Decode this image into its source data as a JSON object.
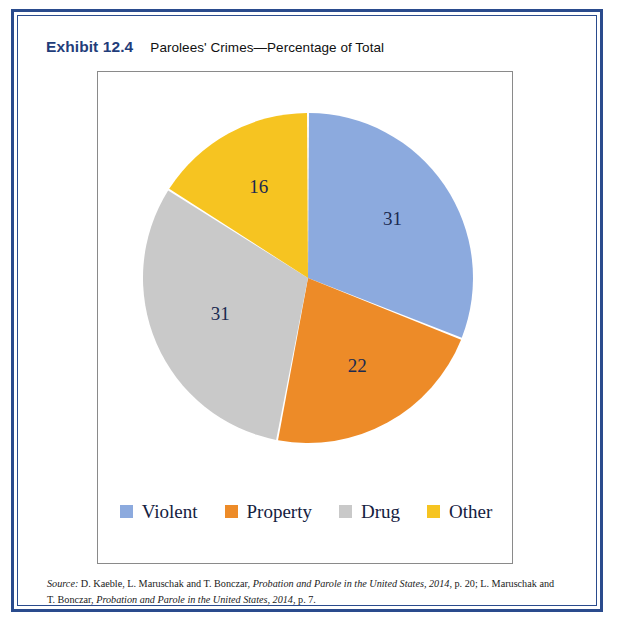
{
  "frame": {
    "border_color": "#2a4b8d"
  },
  "header": {
    "exhibit_label": "Exhibit 12.4",
    "title": "Parolees' Crimes—Percentage of Total"
  },
  "chart_data": {
    "type": "pie",
    "title": "Parolees' Crimes—Percentage of Total",
    "categories": [
      "Violent",
      "Property",
      "Drug",
      "Other"
    ],
    "values": [
      31,
      22,
      31,
      16
    ],
    "value_suffix": "",
    "colors": [
      "#8caade",
      "#ed8b28",
      "#c9c9c9",
      "#f6c421"
    ],
    "legend_position": "bottom",
    "start_angle_deg": 0,
    "direction": "clockwise",
    "slice_gap": true,
    "data_labels": [
      "31",
      "22",
      "31",
      "16"
    ],
    "label_color": "#1b2a50",
    "xlabel": "",
    "ylabel": ""
  },
  "legend": {
    "items": [
      {
        "label": "Violent",
        "color": "#8caade"
      },
      {
        "label": "Property",
        "color": "#ed8b28"
      },
      {
        "label": "Drug",
        "color": "#c9c9c9"
      },
      {
        "label": "Other",
        "color": "#f6c421"
      }
    ]
  },
  "source": {
    "line1_prefix": "Source:",
    "line1_a": " D. Kaeble, L. Maruschak and T. Bonczar, ",
    "line1_italic": "Probation and Parole in the United States, 2014",
    "line1_b": ", p. 20; L. Maruschak and",
    "line2_a": "T. Bonczar, ",
    "line2_italic": "Probation and Parole in the United States, 2014",
    "line2_b": ", p. 7."
  }
}
